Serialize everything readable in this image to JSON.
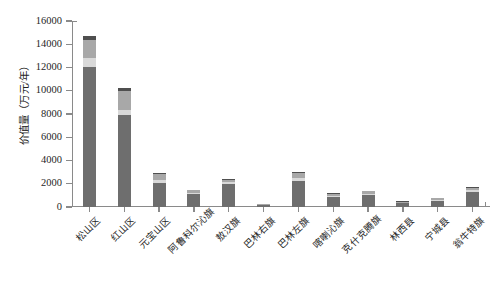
{
  "chart_data": {
    "type": "bar",
    "stacked": true,
    "title": "",
    "subtitle": "",
    "xlabel": "",
    "ylabel": "价值量（万元/年）",
    "ylim": [
      0,
      16000
    ],
    "ytick_labels": [
      "16000",
      "14000",
      "12000",
      "10000",
      "8000",
      "6000",
      "4000",
      "2000",
      "0"
    ],
    "ytick_values": [
      16000,
      14000,
      12000,
      10000,
      8000,
      6000,
      4000,
      2000,
      0
    ],
    "ytick_interval": 2000,
    "grid": false,
    "legend": "none",
    "categories": [
      "松山区",
      "红山区",
      "元宝山区",
      "阿鲁科尔沁旗",
      "敖汉旗",
      "巴林右旗",
      "巴林左旗",
      "喀喇沁旗",
      "克什克腾旗",
      "林西县",
      "宁城县",
      "翁牛特旗"
    ],
    "series": [
      {
        "name": "序列1",
        "color": "#6e6e6e",
        "values": [
          12050,
          7900,
          2100,
          1120,
          1980,
          170,
          2270,
          880,
          1020,
          330,
          520,
          1280
        ]
      },
      {
        "name": "序列2",
        "color": "#d9d9d9",
        "values": [
          760,
          430,
          200,
          120,
          170,
          40,
          220,
          110,
          120,
          50,
          70,
          150
        ]
      },
      {
        "name": "序列3",
        "color": "#a8a8a8",
        "values": [
          1600,
          1660,
          510,
          210,
          190,
          60,
          420,
          170,
          210,
          90,
          150,
          230
        ]
      },
      {
        "name": "序列4",
        "color": "#4f4f4f",
        "values": [
          290,
          210,
          90,
          50,
          60,
          30,
          90,
          40,
          50,
          30,
          60,
          40
        ]
      }
    ],
    "totals": [
      14700,
      10200,
      2900,
      1500,
      2400,
      300,
      3000,
      1200,
      1400,
      500,
      800,
      1700
    ]
  },
  "axis": {
    "axis_color": "#8a8a8a"
  }
}
